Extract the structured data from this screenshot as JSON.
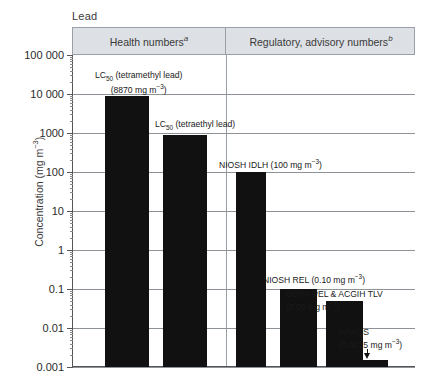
{
  "figure": {
    "title": "Lead",
    "y_axis_title": "Concentration (mg m",
    "y_axis_title_sup": "−3",
    "y_axis_title_end": ")"
  },
  "headers": [
    {
      "label": "Health numbers",
      "note": "a"
    },
    {
      "label": "Regulatory, advisory numbers",
      "note": "b"
    }
  ],
  "y_ticks": [
    {
      "label": "100 000",
      "value": 100000
    },
    {
      "label": "10 000",
      "value": 10000
    },
    {
      "label": "1000",
      "value": 1000
    },
    {
      "label": "100",
      "value": 100
    },
    {
      "label": "10",
      "value": 10
    },
    {
      "label": "1",
      "value": 1
    },
    {
      "label": "0.1",
      "value": 0.1
    },
    {
      "label": "0.01",
      "value": 0.01
    },
    {
      "label": "0.001",
      "value": 0.001
    }
  ],
  "annotations": {
    "bar1_line1_pre": "LC",
    "bar1_line1_sub": "50",
    "bar1_line1_post": "  (tetramethyl lead)",
    "bar1_line2_pre": "(8870 mg m",
    "bar1_line2_sup": "−3",
    "bar1_line2_post": ")",
    "bar2_pre": "LC",
    "bar2_sub": "50",
    "bar2_post": " (tetraethyl lead)",
    "bar3_pre": "NIOSH IDLH (100 mg  m",
    "bar3_sup": "−3",
    "bar3_post": ")",
    "bar4_pre": "NIOSH REL (0.10 mg  m",
    "bar4_sup": "−3",
    "bar4_post": ")",
    "bar5_line1": "OSHA PEL & ACGIH TLV",
    "bar5_line2_pre": "(0.05 mg  m",
    "bar5_line2_sup": "−3",
    "bar5_line2_post": ")",
    "bar6_line1": "NAAQS",
    "bar6_line2_pre": "(0.0015 mg m",
    "bar6_line2_sup": "−3",
    "bar6_line2_post": ")"
  },
  "chart_data": {
    "type": "bar",
    "title": "Lead",
    "xlabel": "",
    "ylabel": "Concentration (mg m−3)",
    "yscale": "log",
    "ylim": [
      0.001,
      100000
    ],
    "grid": true,
    "legend": false,
    "sections": [
      {
        "name": "Health numbers",
        "footnote": "a",
        "categories": [
          "LC50 (tetramethyl lead)",
          "LC50 (tetraethyl lead)"
        ]
      },
      {
        "name": "Regulatory, advisory numbers",
        "footnote": "b",
        "categories": [
          "NIOSH IDLH",
          "NIOSH REL",
          "OSHA PEL & ACGIH TLV",
          "NAAQS"
        ]
      }
    ],
    "categories": [
      "LC50 (tetramethyl lead)",
      "LC50 (tetraethyl lead)",
      "NIOSH IDLH",
      "NIOSH REL / OSHA PEL & ACGIH TLV",
      "NAAQS"
    ],
    "values": [
      8870,
      870,
      100,
      0.1,
      0.0015
    ],
    "bars": [
      {
        "label": "LC50 (tetramethyl lead)",
        "value": 8870,
        "unit": "mg m-3",
        "section": "Health numbers"
      },
      {
        "label": "LC50 (tetraethyl lead)",
        "value": 870,
        "unit": "mg m-3",
        "section": "Health numbers"
      },
      {
        "label": "NIOSH IDLH",
        "value": 100,
        "unit": "mg m-3",
        "section": "Regulatory, advisory numbers"
      },
      {
        "label": "NIOSH REL",
        "value": 0.1,
        "unit": "mg m-3",
        "section": "Regulatory, advisory numbers"
      },
      {
        "label": "OSHA PEL & ACGIH TLV",
        "value": 0.05,
        "unit": "mg m-3",
        "section": "Regulatory, advisory numbers"
      },
      {
        "label": "NAAQS",
        "value": 0.0015,
        "unit": "mg m-3",
        "section": "Regulatory, advisory numbers"
      }
    ],
    "colors": {
      "bar": "#111111",
      "header_band": "#dde0e5",
      "grid": "#8d9299",
      "axis": "#555555"
    }
  }
}
